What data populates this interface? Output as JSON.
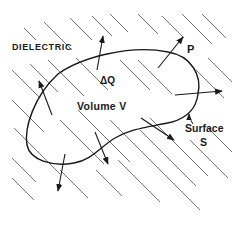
{
  "figure": {
    "type": "physics-diagram",
    "colors": {
      "background": "#ffffff",
      "ink": "#1a1a1a",
      "hatch": "#555555"
    }
  },
  "labels": {
    "dielectric": "DIELECTRIC",
    "charge": "ΔQ",
    "volume": "Volume V",
    "polarization": "P",
    "surface_line1": "Surface",
    "surface_line2": "S"
  },
  "arrows": [
    {
      "name": "top",
      "from": [
        97,
        70
      ],
      "to": [
        103,
        36
      ]
    },
    {
      "name": "top-right-p",
      "from": [
        158,
        68
      ],
      "to": [
        183,
        37
      ]
    },
    {
      "name": "right",
      "from": [
        175,
        95
      ],
      "to": [
        222,
        91
      ]
    },
    {
      "name": "lower-right",
      "from": [
        141,
        118
      ],
      "to": [
        174,
        140
      ]
    },
    {
      "name": "bottom-middle",
      "from": [
        95,
        132
      ],
      "to": [
        108,
        164
      ]
    },
    {
      "name": "bottom-left",
      "from": [
        65,
        154
      ],
      "to": [
        58,
        191
      ]
    },
    {
      "name": "left",
      "from": [
        52,
        115
      ],
      "to": [
        39,
        81
      ]
    }
  ]
}
